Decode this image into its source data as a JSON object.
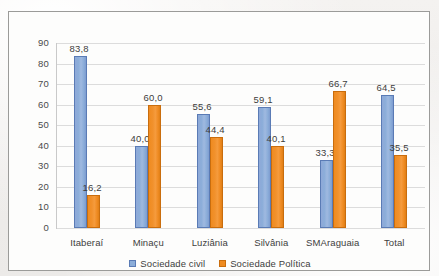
{
  "chart_data": {
    "type": "bar",
    "title": "",
    "xlabel": "",
    "ylabel": "",
    "ylim": [
      0,
      90
    ],
    "ytick_step": 10,
    "yticks": [
      "90",
      "80",
      "70",
      "60",
      "50",
      "40",
      "30",
      "20",
      "10",
      "0"
    ],
    "grid": true,
    "legend_position": "bottom",
    "decimal_separator": ",",
    "categories": [
      "Itaberaí",
      "Minaçu",
      "Luziânia",
      "Silvânia",
      "SMAraguaia",
      "Total"
    ],
    "series": [
      {
        "name": "Sociedade civil",
        "color": "#8badd9",
        "values": [
          83.8,
          40.0,
          55.6,
          59.1,
          33.3,
          64.5
        ],
        "labels": [
          "83,8",
          "40,0",
          "55,6",
          "59,1",
          "33,3",
          "64,5"
        ]
      },
      {
        "name": "Sociedade Política",
        "color": "#ef8b20",
        "values": [
          16.2,
          60.0,
          44.4,
          40.1,
          66.7,
          35.5
        ],
        "labels": [
          "16,2",
          "60,0",
          "44,4",
          "40,1",
          "66,7",
          "35,5"
        ]
      }
    ]
  },
  "legend": {
    "items": [
      {
        "label": "Sociedade civil",
        "marker": "square-swatch-blue"
      },
      {
        "label": "Sociedade Política",
        "marker": "square-swatch-orange"
      }
    ]
  },
  "colors": {
    "series_civil": "#8badd9",
    "series_politica": "#ef8b20",
    "gridline": "#dcdcdc",
    "frame_border": "#9b9b99",
    "plot_background": "#fdfdfc",
    "page_background": "#f1efed",
    "text": "#3d3d3d"
  }
}
